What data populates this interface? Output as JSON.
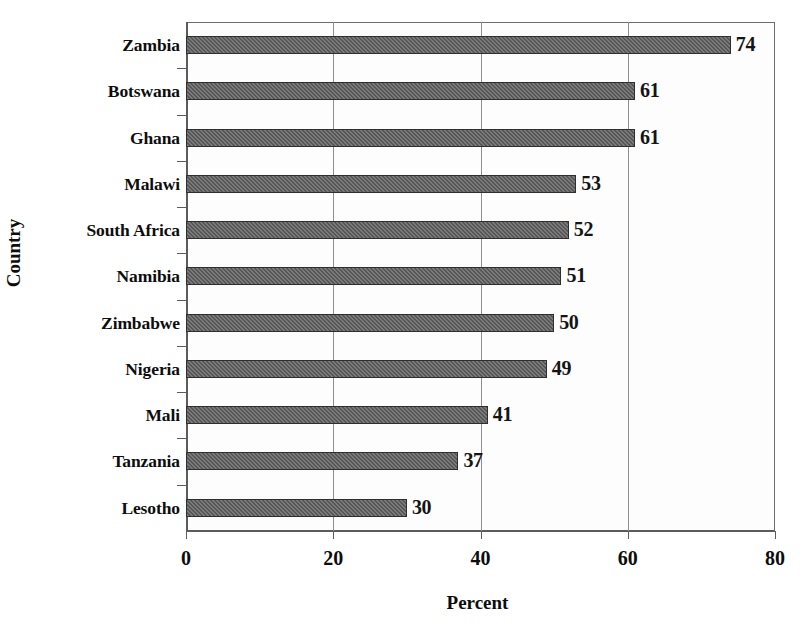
{
  "chart_data": {
    "type": "bar",
    "orientation": "horizontal",
    "title": "",
    "xlabel": "Percent",
    "ylabel": "Country",
    "categories": [
      "Zambia",
      "Botswana",
      "Ghana",
      "Malawi",
      "South Africa",
      "Namibia",
      "Zimbabwe",
      "Nigeria",
      "Mali",
      "Tanzania",
      "Lesotho"
    ],
    "values": [
      74,
      61,
      61,
      53,
      52,
      51,
      50,
      49,
      41,
      37,
      30
    ],
    "value_labels": [
      "74",
      "61",
      "61",
      "53",
      "52",
      "51",
      "50",
      "49",
      "41",
      "37",
      "30"
    ],
    "xlim": [
      0,
      80
    ],
    "xticks": [
      0,
      20,
      40,
      60,
      80
    ],
    "xtick_labels": [
      "0",
      "20",
      "40",
      "60",
      "80"
    ],
    "grid": "vertical",
    "legend": "none",
    "bar_color": "#565656",
    "bar_edge_color": "#2f2f2f",
    "plot_background": "#fdfdfd",
    "axis_color": "#5c5c5c",
    "gridline_color": "#8f8f8f",
    "text_color": "#0d0d0d"
  }
}
